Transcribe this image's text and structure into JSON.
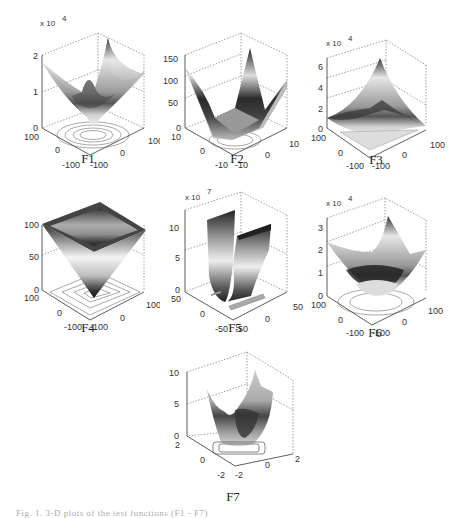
{
  "figure": {
    "caption": "Fig. 1. 3-D plots of the test functions (F1 - F7)",
    "panels": [
      {
        "label": "F1",
        "z_ticks": [
          "0",
          "1",
          "2"
        ],
        "z_multiplier": "x 10",
        "z_exp": "4",
        "x_ticks": [
          "-100",
          "0",
          "100"
        ],
        "y_ticks": [
          "-100",
          "0",
          "100"
        ],
        "shape": "bowl"
      },
      {
        "label": "F2",
        "z_ticks": [
          "0",
          "50",
          "100",
          "150"
        ],
        "z_multiplier": "",
        "z_exp": "",
        "x_ticks": [
          "-10",
          "0",
          "10"
        ],
        "y_ticks": [
          "-10",
          "0",
          "10"
        ],
        "shape": "pyramid-valley"
      },
      {
        "label": "F3",
        "z_ticks": [
          "0",
          "2",
          "4",
          "6"
        ],
        "z_multiplier": "x 10",
        "z_exp": "4",
        "x_ticks": [
          "-100",
          "0",
          "100"
        ],
        "y_ticks": [
          "-100",
          "0",
          "100"
        ],
        "shape": "tilted-bowl"
      },
      {
        "label": "F4",
        "z_ticks": [
          "0",
          "50",
          "100"
        ],
        "z_multiplier": "",
        "z_exp": "",
        "x_ticks": [
          "-100",
          "0",
          "100"
        ],
        "y_ticks": [
          "-100",
          "0",
          "100"
        ],
        "shape": "inverted-pyramid"
      },
      {
        "label": "F5",
        "z_ticks": [
          "0",
          "5",
          "10"
        ],
        "z_multiplier": "x 10",
        "z_exp": "7",
        "x_ticks": [
          "-50",
          "0",
          "50"
        ],
        "y_ticks": [
          "-50",
          "0",
          "50"
        ],
        "shape": "u-valley"
      },
      {
        "label": "F6",
        "z_ticks": [
          "0",
          "1",
          "2",
          "3"
        ],
        "z_multiplier": "x 10",
        "z_exp": "4",
        "x_ticks": [
          "-100",
          "0",
          "100"
        ],
        "y_ticks": [
          "-100",
          "0",
          "100"
        ],
        "shape": "bowl"
      },
      {
        "label": "F7",
        "z_ticks": [
          "0",
          "5",
          "10"
        ],
        "z_multiplier": "",
        "z_exp": "",
        "x_ticks": [
          "-2",
          "0",
          "2"
        ],
        "y_ticks": [
          "-2",
          "0",
          "2"
        ],
        "shape": "noisy-bowl"
      }
    ]
  }
}
